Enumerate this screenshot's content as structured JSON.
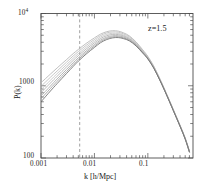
{
  "figure": {
    "background_color": "#ffffff",
    "frame_color": "#4d4d4d"
  },
  "annotations": {
    "redshift_label": "z=1.5"
  },
  "axes": {
    "x": {
      "label": "k  [h/Mpc]",
      "tick_labels": [
        "0.001",
        "0.01",
        "0.1"
      ]
    },
    "y": {
      "label": "P(k)",
      "tick_labels": [
        "100",
        "1000",
        "10"
      ],
      "top_exponent": "4"
    }
  },
  "chart_data": {
    "type": "line",
    "title": "",
    "xlabel": "k  [h/Mpc]",
    "ylabel": "P(k)",
    "xscale": "log",
    "yscale": "log",
    "xlim": [
      0.001,
      0.7
    ],
    "ylim": [
      100,
      10000
    ],
    "xticks": [
      0.001,
      0.01,
      0.1
    ],
    "xticklabels": [
      "0.001",
      "0.01",
      "0.1"
    ],
    "yticks": [
      100,
      1000,
      10000
    ],
    "yticklabels": [
      "100",
      "1000",
      "10^4"
    ],
    "grid": false,
    "legend": null,
    "annotations": [
      {
        "text": "z=1.5",
        "x": 0.22,
        "y": 6200
      }
    ],
    "vlines": [
      {
        "x": 0.0053,
        "style": "dashed",
        "color": "#888888",
        "label": ""
      }
    ],
    "x": [
      0.001,
      0.0015,
      0.002,
      0.003,
      0.004,
      0.005,
      0.007,
      0.01,
      0.013,
      0.017,
      0.022,
      0.028,
      0.035,
      0.045,
      0.06,
      0.08,
      0.1,
      0.13,
      0.17,
      0.22,
      0.3,
      0.4,
      0.5,
      0.6
    ],
    "series": [
      {
        "name": "model-1-upper",
        "color": "#b5b5b5",
        "values": [
          1100,
          1450,
          1760,
          2300,
          2780,
          3180,
          3850,
          4600,
          5180,
          5600,
          5780,
          5700,
          5400,
          4900,
          4050,
          3150,
          2550,
          1850,
          1230,
          800,
          470,
          285,
          190,
          125
        ]
      },
      {
        "name": "model-2",
        "color": "#bdbdbd",
        "values": [
          980,
          1310,
          1600,
          2120,
          2580,
          2970,
          3620,
          4360,
          4950,
          5380,
          5560,
          5500,
          5220,
          4760,
          3950,
          3080,
          2500,
          1820,
          1210,
          790,
          465,
          282,
          188,
          124
        ]
      },
      {
        "name": "model-3",
        "color": "#c4c4c4",
        "values": [
          880,
          1190,
          1470,
          1960,
          2400,
          2780,
          3410,
          4130,
          4720,
          5140,
          5330,
          5290,
          5040,
          4610,
          3850,
          3010,
          2450,
          1790,
          1195,
          782,
          460,
          279,
          186,
          123
        ]
      },
      {
        "name": "model-4",
        "color": "#b0b0b0",
        "values": [
          800,
          1090,
          1350,
          1820,
          2240,
          2610,
          3220,
          3920,
          4500,
          4920,
          5130,
          5110,
          4890,
          4490,
          3770,
          2960,
          2420,
          1770,
          1185,
          778,
          458,
          278,
          185,
          122
        ]
      },
      {
        "name": "model-5",
        "color": "#a8a8a8",
        "values": [
          720,
          990,
          1240,
          1680,
          2080,
          2440,
          3030,
          3710,
          4280,
          4700,
          4920,
          4920,
          4730,
          4370,
          3690,
          2910,
          2390,
          1755,
          1178,
          775,
          456,
          277,
          184,
          122
        ]
      },
      {
        "name": "model-6",
        "color": "#9e9e9e",
        "values": [
          660,
          915,
          1150,
          1570,
          1960,
          2310,
          2880,
          3540,
          4100,
          4520,
          4750,
          4770,
          4600,
          4270,
          3620,
          2870,
          2365,
          1742,
          1172,
          772,
          454,
          276,
          184,
          121
        ]
      },
      {
        "name": "model-7-lower",
        "color": "#6e6e6e",
        "values": [
          600,
          845,
          1070,
          1475,
          1850,
          2190,
          2745,
          3390,
          3940,
          4360,
          4600,
          4640,
          4490,
          4180,
          3565,
          2835,
          2345,
          1730,
          1166,
          769,
          452,
          275,
          183,
          121
        ]
      }
    ]
  }
}
